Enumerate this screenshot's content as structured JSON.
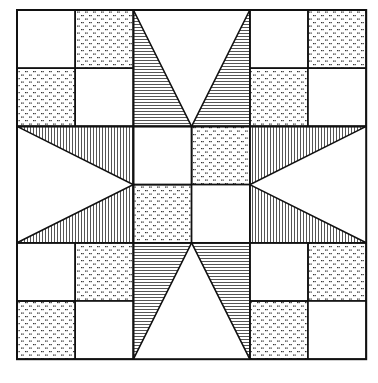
{
  "grid": {
    "cols": 6,
    "rows": 6,
    "origin": [
      17,
      10
    ],
    "cell_size": 58.2
  },
  "colors": {
    "line": "#111111",
    "background": "#ffffff",
    "stripe": "#555555",
    "dot": "#333333"
  },
  "fills": {
    "white": "plain white",
    "dotted": "stippled dot pattern",
    "hstripe": "horizontal stripes",
    "vstripe": "vertical stripes"
  },
  "squares": [
    {
      "c": 0,
      "r": 0,
      "fill": "white"
    },
    {
      "c": 1,
      "r": 0,
      "fill": "dotted"
    },
    {
      "c": 0,
      "r": 1,
      "fill": "dotted"
    },
    {
      "c": 1,
      "r": 1,
      "fill": "white"
    },
    {
      "c": 4,
      "r": 0,
      "fill": "white"
    },
    {
      "c": 5,
      "r": 0,
      "fill": "dotted"
    },
    {
      "c": 4,
      "r": 1,
      "fill": "dotted"
    },
    {
      "c": 5,
      "r": 1,
      "fill": "white"
    },
    {
      "c": 0,
      "r": 4,
      "fill": "white"
    },
    {
      "c": 1,
      "r": 4,
      "fill": "dotted"
    },
    {
      "c": 0,
      "r": 5,
      "fill": "dotted"
    },
    {
      "c": 1,
      "r": 5,
      "fill": "white"
    },
    {
      "c": 4,
      "r": 4,
      "fill": "white"
    },
    {
      "c": 5,
      "r": 4,
      "fill": "dotted"
    },
    {
      "c": 4,
      "r": 5,
      "fill": "dotted"
    },
    {
      "c": 5,
      "r": 5,
      "fill": "white"
    },
    {
      "c": 2,
      "r": 2,
      "fill": "white"
    },
    {
      "c": 3,
      "r": 2,
      "fill": "dotted"
    },
    {
      "c": 2,
      "r": 3,
      "fill": "dotted"
    },
    {
      "c": 3,
      "r": 3,
      "fill": "white"
    }
  ],
  "triangles": [
    {
      "name": "top-left-star-point",
      "fill": "hstripe",
      "pts": [
        [
          2,
          0
        ],
        [
          3,
          2
        ],
        [
          2,
          2
        ]
      ]
    },
    {
      "name": "top-right-star-point",
      "fill": "hstripe",
      "pts": [
        [
          4,
          0
        ],
        [
          4,
          2
        ],
        [
          3,
          2
        ]
      ]
    },
    {
      "name": "bottom-left-star-point",
      "fill": "hstripe",
      "pts": [
        [
          2,
          4
        ],
        [
          3,
          4
        ],
        [
          2,
          6
        ]
      ]
    },
    {
      "name": "bottom-right-star-point",
      "fill": "hstripe",
      "pts": [
        [
          3,
          4
        ],
        [
          4,
          4
        ],
        [
          4,
          6
        ]
      ]
    },
    {
      "name": "left-upper-star-point",
      "fill": "vstripe",
      "pts": [
        [
          0,
          2
        ],
        [
          2,
          2
        ],
        [
          2,
          3
        ]
      ]
    },
    {
      "name": "left-lower-star-point",
      "fill": "vstripe",
      "pts": [
        [
          2,
          3
        ],
        [
          2,
          4
        ],
        [
          0,
          4
        ]
      ]
    },
    {
      "name": "right-upper-star-point",
      "fill": "vstripe",
      "pts": [
        [
          4,
          2
        ],
        [
          6,
          2
        ],
        [
          4,
          3
        ]
      ]
    },
    {
      "name": "right-lower-star-point",
      "fill": "vstripe",
      "pts": [
        [
          4,
          3
        ],
        [
          6,
          4
        ],
        [
          4,
          4
        ]
      ]
    }
  ]
}
